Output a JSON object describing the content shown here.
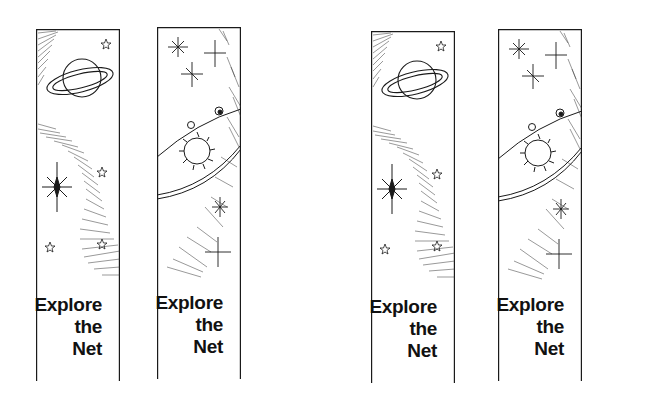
{
  "sheet": {
    "title": "Bookmark sheet",
    "ink_color": "#1a1a1a",
    "bookmarks": [
      {
        "design": "saturn-galaxy",
        "caption": [
          "Explore",
          "the",
          "Net"
        ]
      },
      {
        "design": "sun-orbit",
        "caption": [
          "Explore",
          "the",
          "Net"
        ]
      },
      {
        "design": "saturn-galaxy",
        "caption": [
          "Explore",
          "the",
          "Net"
        ]
      },
      {
        "design": "sun-orbit",
        "caption": [
          "Explore",
          "the",
          "Net"
        ]
      }
    ]
  }
}
